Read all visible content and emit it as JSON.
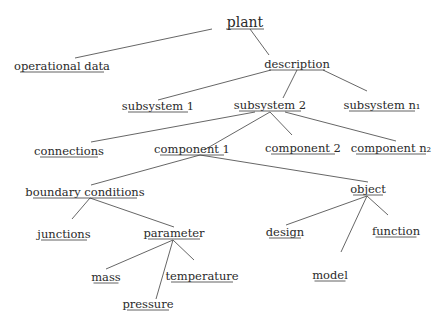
{
  "diagram": {
    "type": "tree",
    "title": "plant",
    "nodes": [
      {
        "id": "plant",
        "label": "plant",
        "x": 245,
        "y": 27,
        "w": 38,
        "root": true
      },
      {
        "id": "operational_data",
        "label": "operational data",
        "x": 62,
        "y": 70,
        "w": 84
      },
      {
        "id": "description",
        "label": "description",
        "x": 297,
        "y": 68,
        "w": 56
      },
      {
        "id": "subsystem_1",
        "label": "subsystem 1",
        "x": 158,
        "y": 110,
        "w": 60
      },
      {
        "id": "subsystem_2",
        "label": "subsystem 2",
        "x": 270,
        "y": 109,
        "w": 62
      },
      {
        "id": "subsystem_n1",
        "label": "subsystem n₁",
        "x": 382,
        "y": 109,
        "w": 66
      },
      {
        "id": "connections",
        "label": "connections",
        "x": 69,
        "y": 155,
        "w": 58
      },
      {
        "id": "component_1",
        "label": "component 1",
        "x": 192,
        "y": 153,
        "w": 64
      },
      {
        "id": "component_2",
        "label": "component 2",
        "x": 303,
        "y": 152,
        "w": 64
      },
      {
        "id": "component_n2",
        "label": "component n₂",
        "x": 391,
        "y": 152,
        "w": 70
      },
      {
        "id": "boundary_conditions",
        "label": "boundary conditions",
        "x": 85,
        "y": 196,
        "w": 104
      },
      {
        "id": "object",
        "label": "object",
        "x": 368,
        "y": 193,
        "w": 30
      },
      {
        "id": "junctions",
        "label": "junctions",
        "x": 64,
        "y": 238,
        "w": 46
      },
      {
        "id": "parameter",
        "label": "parameter",
        "x": 174,
        "y": 237,
        "w": 52
      },
      {
        "id": "design",
        "label": "design",
        "x": 285,
        "y": 236,
        "w": 32
      },
      {
        "id": "function",
        "label": "function",
        "x": 396,
        "y": 235,
        "w": 41
      },
      {
        "id": "mass",
        "label": "mass",
        "x": 106,
        "y": 281,
        "w": 25
      },
      {
        "id": "temperature",
        "label": "temperature",
        "x": 202,
        "y": 280,
        "w": 62
      },
      {
        "id": "model",
        "label": "model",
        "x": 330,
        "y": 279,
        "w": 31
      },
      {
        "id": "pressure",
        "label": "pressure",
        "x": 148,
        "y": 308,
        "w": 42
      }
    ],
    "edges": [
      {
        "from": "plant",
        "to": "operational_data",
        "x1": 212,
        "y1": 29,
        "x2": 75,
        "y2": 58
      },
      {
        "from": "plant",
        "to": "description",
        "x1": 250,
        "y1": 29,
        "x2": 269,
        "y2": 55
      },
      {
        "from": "description",
        "to": "subsystem_1",
        "x1": 271,
        "y1": 70,
        "x2": 158,
        "y2": 100
      },
      {
        "from": "description",
        "to": "subsystem_2",
        "x1": 297,
        "y1": 70,
        "x2": 283,
        "y2": 98
      },
      {
        "from": "description",
        "to": "subsystem_n1",
        "x1": 323,
        "y1": 70,
        "x2": 367,
        "y2": 91
      },
      {
        "from": "subsystem_2",
        "to": "connections",
        "x1": 255,
        "y1": 112,
        "x2": 91,
        "y2": 142
      },
      {
        "from": "subsystem_2",
        "to": "component_1",
        "x1": 270,
        "y1": 112,
        "x2": 204,
        "y2": 150
      },
      {
        "from": "subsystem_2",
        "to": "component_2",
        "x1": 270,
        "y1": 112,
        "x2": 292,
        "y2": 135
      },
      {
        "from": "subsystem_2",
        "to": "component_n2",
        "x1": 285,
        "y1": 112,
        "x2": 396,
        "y2": 141
      },
      {
        "from": "component_1",
        "to": "boundary_conditions",
        "x1": 200,
        "y1": 155,
        "x2": 91,
        "y2": 185
      },
      {
        "from": "component_1",
        "to": "object",
        "x1": 200,
        "y1": 155,
        "x2": 368,
        "y2": 182
      },
      {
        "from": "boundary_conditions",
        "to": "junctions",
        "x1": 90,
        "y1": 198,
        "x2": 72,
        "y2": 219
      },
      {
        "from": "boundary_conditions",
        "to": "parameter",
        "x1": 90,
        "y1": 198,
        "x2": 174,
        "y2": 227
      },
      {
        "from": "object",
        "to": "design",
        "x1": 367,
        "y1": 196,
        "x2": 286,
        "y2": 225
      },
      {
        "from": "object",
        "to": "model",
        "x1": 367,
        "y1": 196,
        "x2": 341,
        "y2": 252
      },
      {
        "from": "object",
        "to": "function",
        "x1": 367,
        "y1": 196,
        "x2": 388,
        "y2": 215
      },
      {
        "from": "parameter",
        "to": "mass",
        "x1": 173,
        "y1": 240,
        "x2": 106,
        "y2": 269
      },
      {
        "from": "parameter",
        "to": "temperature",
        "x1": 173,
        "y1": 240,
        "x2": 194,
        "y2": 260
      },
      {
        "from": "parameter",
        "to": "pressure",
        "x1": 173,
        "y1": 240,
        "x2": 156,
        "y2": 299
      }
    ]
  },
  "colors": {
    "text": "#2a2a2a",
    "edge": "#555555",
    "background": "#ffffff"
  }
}
